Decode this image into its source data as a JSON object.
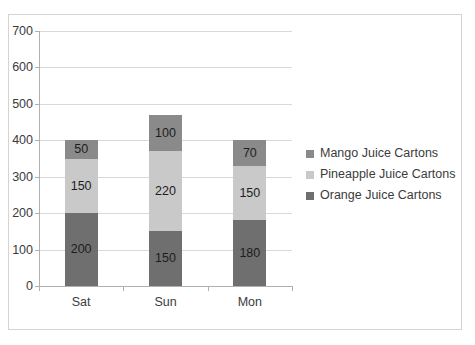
{
  "chart_data": {
    "type": "bar",
    "subtype": "stacked-bar",
    "title": "",
    "xlabel": "",
    "ylabel": "",
    "categories": [
      "Sat",
      "Sun",
      "Mon"
    ],
    "series": [
      {
        "name": "Orange Juice Cartons",
        "values": [
          200,
          150,
          180
        ],
        "color": "#6f6f6f"
      },
      {
        "name": "Pineapple Juice Cartons",
        "values": [
          150,
          220,
          150
        ],
        "color": "#c9c9c9"
      },
      {
        "name": "Mango Juice Cartons",
        "values": [
          50,
          100,
          70
        ],
        "color": "#8a8a8a"
      }
    ],
    "stack_order_bottom_to_top": [
      "Orange Juice Cartons",
      "Pineapple Juice Cartons",
      "Mango Juice Cartons"
    ],
    "totals": [
      400,
      600,
      400
    ],
    "ylim": [
      0,
      700
    ],
    "ytick_step": 100,
    "yticks": [
      0,
      100,
      200,
      300,
      400,
      500,
      600,
      700
    ],
    "ytick_labels": [
      "0",
      "100",
      "200",
      "300",
      "400",
      "500",
      "600",
      "700"
    ],
    "grid": true,
    "grid_axis": "y",
    "legend_position": "right",
    "data_labels": true
  },
  "legend": {
    "items": [
      {
        "label": "Mango Juice Cartons",
        "color": "#8a8a8a"
      },
      {
        "label": "Pineapple Juice Cartons",
        "color": "#c9c9c9"
      },
      {
        "label": "Orange Juice Cartons",
        "color": "#6f6f6f"
      }
    ]
  },
  "colors": {
    "mango": "#8a8a8a",
    "pineapple": "#c9c9c9",
    "orange": "#6f6f6f",
    "gridline": "#d9d9d9",
    "axis": "#b0b0b0",
    "border": "#d4d4d4",
    "text": "#3b3b3b",
    "label_text": "#1d1d1d",
    "background": "#ffffff"
  }
}
